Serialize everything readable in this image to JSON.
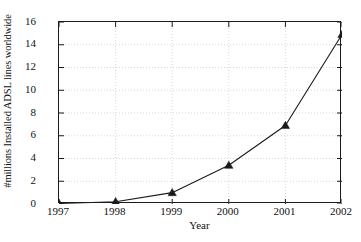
{
  "chart_data": {
    "type": "line",
    "title": "",
    "xlabel": "Year",
    "ylabel": "#millions Installed ADSL lines worldwide",
    "categories": [
      "1997",
      "1998",
      "1999",
      "2000",
      "2001",
      "2002"
    ],
    "x": [
      1997,
      1998,
      1999,
      2000,
      2001,
      2002
    ],
    "values": [
      0.05,
      0.2,
      1.0,
      3.4,
      6.9,
      14.9
    ],
    "series": [
      {
        "name": "Installed ADSL lines",
        "values": [
          0.05,
          0.2,
          1.0,
          3.4,
          6.9,
          14.9
        ]
      }
    ],
    "xlim": [
      1997,
      2002
    ],
    "ylim": [
      0,
      16
    ],
    "yticks": [
      "0",
      "2",
      "4",
      "6",
      "8",
      "10",
      "12",
      "14",
      "16"
    ],
    "ytick_values": [
      0,
      2,
      4,
      6,
      8,
      10,
      12,
      14,
      16
    ],
    "xticks": [
      "1997",
      "1998",
      "1999",
      "2000",
      "2001",
      "2002"
    ],
    "grid": true,
    "grid_style": "dotted",
    "legend": "none",
    "marker": "filled-triangle",
    "line_color": "#1a1a1a",
    "marker_color": "#1a1a1a",
    "grid_color": "#c8c8c8",
    "axis_color": "#1a1a1a",
    "background_color": "#ffffff"
  }
}
